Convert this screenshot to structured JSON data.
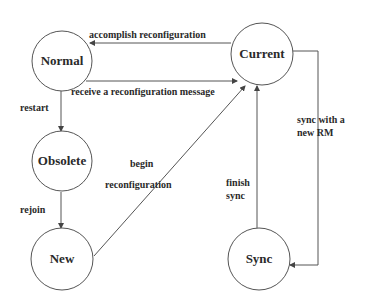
{
  "diagram": {
    "type": "state-transition",
    "nodes": [
      {
        "id": "normal",
        "label": "Normal"
      },
      {
        "id": "current",
        "label": "Current"
      },
      {
        "id": "obsolete",
        "label": "Obsolete"
      },
      {
        "id": "new",
        "label": "New"
      },
      {
        "id": "sync",
        "label": "Sync"
      }
    ],
    "edges": [
      {
        "from": "current",
        "to": "normal",
        "label": "accomplish reconfiguration"
      },
      {
        "from": "normal",
        "to": "current",
        "label": "receive a reconfiguration message"
      },
      {
        "from": "normal",
        "to": "obsolete",
        "label": "restart"
      },
      {
        "from": "obsolete",
        "to": "new",
        "label": "rejoin"
      },
      {
        "from": "new",
        "to": "current",
        "label_line1": "begin",
        "label_line2": "reconfiguration"
      },
      {
        "from": "sync",
        "to": "current",
        "label_line1": "finish",
        "label_line2": "sync"
      },
      {
        "from": "current",
        "to": "sync",
        "label_line1": "sync with a",
        "label_line2": "new RM"
      }
    ]
  }
}
